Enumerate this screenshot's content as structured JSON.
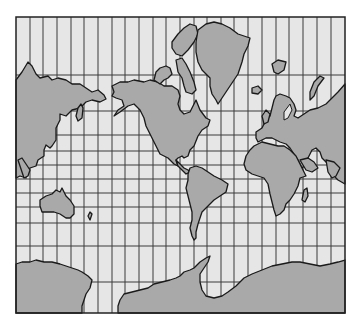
{
  "map": {
    "projection": "Mercator",
    "colors": {
      "ocean": "#e6e6e6",
      "land": "#a9a9a9",
      "coastline": "#1a1a1a",
      "graticule": "#3a3a3a",
      "background": "#ffffff"
    },
    "frame": {
      "x": 16,
      "y": 17,
      "width": 329,
      "height": 296
    },
    "graticule": {
      "meridians_x": [
        30,
        43,
        57,
        71,
        84,
        98,
        112,
        125,
        139,
        153,
        166,
        180,
        194,
        207,
        221,
        234,
        248,
        262,
        276,
        289,
        303,
        317,
        331
      ],
      "parallels_y": [
        75,
        111,
        135,
        151,
        165,
        179,
        193,
        207,
        223,
        246,
        282
      ]
    },
    "landmasses": [
      "Eurasia (east, left edge)",
      "North America",
      "Greenland",
      "Arctic Archipelago",
      "Svalbard",
      "Novaya Zemlya",
      "Europe / Asia",
      "Africa",
      "Madagascar",
      "South America",
      "Australia",
      "Japan",
      "Antarctica"
    ]
  }
}
